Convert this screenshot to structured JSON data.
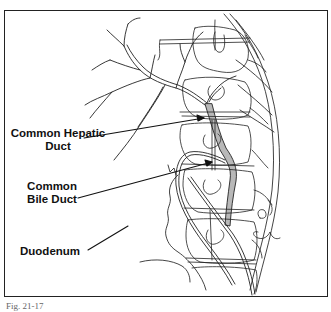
{
  "figure": {
    "caption": "Fig. 21-17",
    "labels": {
      "common_hepatic_duct": "Common Hepatic Duct",
      "common_bile_duct": "Common Bile Duct",
      "duodenum": "Duodenum"
    },
    "colors": {
      "line": "#222222",
      "duct_fill": "#b8b8b8",
      "background": "#ffffff"
    }
  }
}
